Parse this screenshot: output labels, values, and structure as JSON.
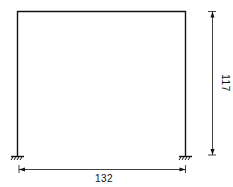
{
  "diagram": {
    "type": "portal-frame",
    "span": {
      "label": "132",
      "value": 132
    },
    "height": {
      "label": "117",
      "value": 117
    },
    "supports": [
      "fixed",
      "fixed"
    ],
    "colors": {
      "line": "#111111",
      "background": "#ffffff"
    }
  }
}
